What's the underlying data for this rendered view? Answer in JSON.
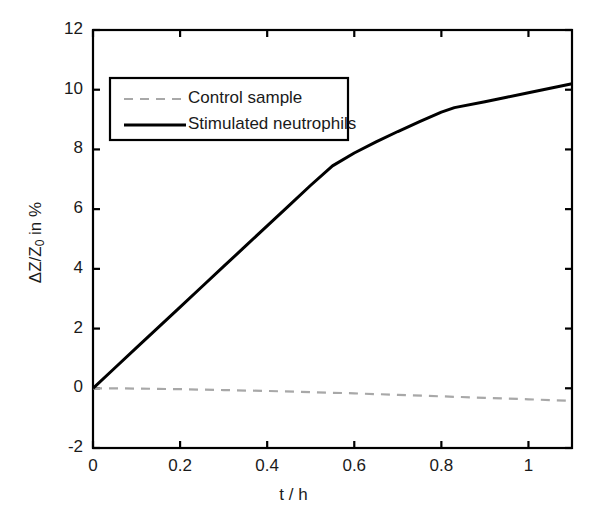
{
  "chart_data": {
    "type": "line",
    "title": "",
    "xlabel": "t / h",
    "ylabel": "ΔZ/Z0 in %",
    "ylabel_parts": {
      "pre": "ΔZ/Z",
      "sub": "0",
      "post": " in %"
    },
    "xlim": [
      0,
      1.1
    ],
    "ylim": [
      -2,
      12
    ],
    "xticks": [
      0,
      0.2,
      0.4,
      0.6,
      0.8,
      1
    ],
    "xtick_labels": [
      "0",
      "0.2",
      "0.4",
      "0.6",
      "0.8",
      "1"
    ],
    "yticks": [
      -2,
      0,
      2,
      4,
      6,
      8,
      10,
      12
    ],
    "ytick_labels": [
      "-2",
      "0",
      "2",
      "4",
      "6",
      "8",
      "10",
      "12"
    ],
    "grid": false,
    "legend_position": "upper left",
    "series": [
      {
        "name": "Control sample",
        "style": "dashed",
        "color": "#a8a8a8",
        "x": [
          0,
          0.05,
          0.1,
          0.15,
          0.2,
          0.3,
          0.4,
          0.5,
          0.6,
          0.7,
          0.8,
          0.9,
          1.0,
          1.1
        ],
        "values": [
          0.0,
          0.0,
          -0.01,
          -0.02,
          -0.03,
          -0.06,
          -0.09,
          -0.13,
          -0.17,
          -0.22,
          -0.27,
          -0.32,
          -0.37,
          -0.42
        ]
      },
      {
        "name": "Stimulated neutrophils",
        "style": "solid",
        "color": "#000000",
        "x": [
          0,
          0.05,
          0.1,
          0.15,
          0.2,
          0.25,
          0.3,
          0.35,
          0.4,
          0.45,
          0.5,
          0.55,
          0.6,
          0.65,
          0.7,
          0.75,
          0.8,
          0.83,
          0.9,
          0.95,
          1.0,
          1.05,
          1.1
        ],
        "values": [
          0.0,
          0.68,
          1.36,
          2.04,
          2.72,
          3.4,
          4.08,
          4.76,
          5.44,
          6.12,
          6.8,
          7.45,
          7.88,
          8.25,
          8.6,
          8.93,
          9.25,
          9.4,
          9.6,
          9.75,
          9.9,
          10.05,
          10.2
        ]
      }
    ],
    "legend": [
      {
        "label": "Control sample",
        "style": "dashed",
        "color": "#a8a8a8"
      },
      {
        "label": "Stimulated neutrophils",
        "style": "solid",
        "color": "#000000"
      }
    ]
  },
  "axes": {
    "line_color": "#000000"
  }
}
